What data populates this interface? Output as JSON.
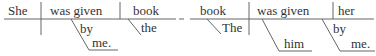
{
  "diagrams": [
    {
      "subject": "She",
      "verb": "was given",
      "object": "book",
      "object_modifier": "the",
      "verb_preposition": "by",
      "preposition_object": "me."
    },
    {
      "subject": "book",
      "subject_modifier": "The",
      "verb": "was given",
      "object": "her",
      "verb_preposition_object_implicit": "him",
      "object_preposition": "by",
      "preposition_object": "me."
    }
  ]
}
